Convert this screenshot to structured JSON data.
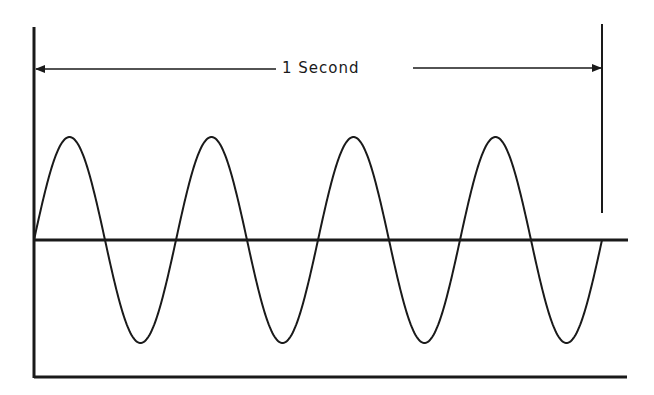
{
  "diagram": {
    "span_label": "1 Second",
    "cycles": 4,
    "stroke_color": "#1a1a1a",
    "background": "#ffffff",
    "geometry": {
      "x_start": 34,
      "x_end": 602,
      "center_y": 240,
      "amplitude": 103,
      "baseline_x_end": 628,
      "bottom_line_y": 377,
      "arrow_y": 69,
      "left_bar_top": 27,
      "right_bar_top": 24,
      "right_bar_bottom": 213
    }
  }
}
